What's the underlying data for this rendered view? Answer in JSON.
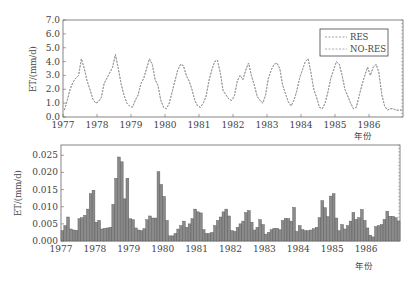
{
  "chart_data": [
    {
      "type": "line",
      "title": "",
      "xlabel": "年份",
      "ylabel": "ET/(mm/d)",
      "ylim": [
        0,
        7
      ],
      "yticks": [
        "0.0",
        "1.0",
        "2.0",
        "3.0",
        "4.0",
        "5.0",
        "6.0",
        "7.0"
      ],
      "xticks": [
        "1977",
        "1978",
        "1979",
        "1980",
        "1981",
        "1982",
        "1983",
        "1984",
        "1985",
        "1986"
      ],
      "legend": {
        "position": "upper right",
        "entries": [
          "RES",
          "NO-RES"
        ]
      },
      "x_start": "1977-01",
      "frequency": "monthly",
      "series": [
        {
          "name": "RES",
          "values": [
            0.5,
            1.2,
            2.0,
            2.5,
            2.8,
            3.0,
            4.2,
            3.5,
            2.6,
            2.0,
            1.3,
            1.0,
            1.1,
            1.4,
            2.4,
            2.8,
            3.2,
            3.6,
            4.5,
            3.5,
            2.4,
            1.6,
            1.0,
            0.8,
            0.7,
            1.2,
            1.6,
            2.4,
            2.8,
            3.5,
            4.2,
            3.8,
            2.7,
            2.3,
            1.2,
            0.7,
            0.6,
            1.0,
            1.8,
            2.6,
            3.4,
            3.8,
            3.7,
            3.0,
            2.6,
            2.0,
            1.2,
            0.8,
            0.7,
            1.0,
            1.5,
            2.6,
            3.4,
            4.0,
            4.1,
            3.2,
            1.9,
            1.6,
            1.3,
            1.2,
            1.5,
            2.6,
            3.0,
            2.7,
            3.4,
            3.9,
            3.0,
            2.3,
            1.5,
            1.2,
            1.0,
            1.6,
            2.8,
            3.4,
            3.8,
            3.9,
            3.5,
            2.3,
            1.7,
            1.1,
            0.8,
            1.2,
            1.9,
            2.8,
            3.4,
            4.0,
            4.2,
            3.2,
            2.0,
            1.4,
            0.7,
            0.6,
            1.0,
            1.8,
            2.8,
            3.4,
            4.0,
            3.8,
            3.0,
            2.0,
            1.5,
            1.0,
            0.6,
            0.7,
            1.5,
            2.3,
            3.0,
            3.6,
            3.0,
            3.6,
            3.8,
            3.2,
            1.6,
            0.8,
            0.5,
            0.6,
            0.6,
            0.5,
            0.5,
            0.5
          ]
        },
        {
          "name": "NO-RES",
          "values": [
            0.5,
            1.2,
            2.0,
            2.5,
            2.8,
            3.0,
            4.2,
            3.5,
            2.6,
            2.0,
            1.3,
            1.0,
            1.1,
            1.4,
            2.4,
            2.8,
            3.2,
            3.6,
            4.5,
            3.5,
            2.4,
            1.6,
            1.0,
            0.8,
            0.7,
            1.2,
            1.6,
            2.4,
            2.8,
            3.5,
            4.2,
            3.8,
            2.7,
            2.3,
            1.2,
            0.7,
            0.6,
            1.0,
            1.8,
            2.6,
            3.4,
            3.8,
            3.7,
            3.0,
            2.6,
            2.0,
            1.2,
            0.8,
            0.7,
            1.0,
            1.5,
            2.6,
            3.4,
            4.0,
            4.1,
            3.2,
            1.9,
            1.6,
            1.3,
            1.2,
            1.5,
            2.6,
            3.0,
            2.7,
            3.4,
            3.9,
            3.0,
            2.3,
            1.5,
            1.2,
            1.0,
            1.6,
            2.8,
            3.4,
            3.8,
            3.9,
            3.5,
            2.3,
            1.7,
            1.1,
            0.8,
            1.2,
            1.9,
            2.8,
            3.4,
            4.0,
            4.2,
            3.2,
            2.0,
            1.4,
            0.7,
            0.6,
            1.0,
            1.8,
            2.8,
            3.4,
            4.0,
            3.8,
            3.0,
            2.0,
            1.5,
            1.0,
            0.6,
            0.7,
            1.5,
            2.3,
            3.0,
            3.6,
            3.0,
            3.6,
            3.8,
            3.2,
            1.6,
            0.8,
            0.5,
            0.6,
            0.6,
            0.5,
            0.5,
            0.5
          ]
        }
      ]
    },
    {
      "type": "bar",
      "title": "",
      "xlabel": "年份",
      "ylabel": "ET/(mm/d)",
      "ylim": [
        0,
        0.028
      ],
      "yticks": [
        "0.000",
        "0.005",
        "0.010",
        "0.015",
        "0.020",
        "0.025"
      ],
      "xticks": [
        "1977",
        "1978",
        "1979",
        "1980",
        "1981",
        "1982",
        "1983",
        "1984",
        "1985",
        "1986"
      ],
      "x_start": "1977-01",
      "frequency": "monthly",
      "series": [
        {
          "name": "RES − NO-RES difference",
          "values": [
            0.003,
            0.0045,
            0.007,
            0.0035,
            0.0032,
            0.0031,
            0.0065,
            0.0068,
            0.0075,
            0.0093,
            0.0138,
            0.0148,
            0.0055,
            0.006,
            0.0035,
            0.0037,
            0.0038,
            0.004,
            0.0107,
            0.0183,
            0.0245,
            0.0231,
            0.0123,
            0.0183,
            0.0065,
            0.0062,
            0.0038,
            0.0032,
            0.003,
            0.0036,
            0.0062,
            0.0073,
            0.0067,
            0.0067,
            0.0202,
            0.0165,
            0.013,
            0.006,
            0.0015,
            0.0015,
            0.0022,
            0.0035,
            0.0045,
            0.0058,
            0.004,
            0.005,
            0.0065,
            0.0093,
            0.0085,
            0.0082,
            0.0033,
            0.0022,
            0.0022,
            0.0025,
            0.0045,
            0.006,
            0.007,
            0.0085,
            0.0093,
            0.0073,
            0.003,
            0.0028,
            0.004,
            0.005,
            0.0058,
            0.0083,
            0.0089,
            0.0055,
            0.0032,
            0.004,
            0.0062,
            0.0048,
            0.002,
            0.0025,
            0.0033,
            0.0037,
            0.0037,
            0.0033,
            0.006,
            0.0066,
            0.0065,
            0.0058,
            0.0098,
            0.0028,
            0.0045,
            0.0033,
            0.003,
            0.003,
            0.0032,
            0.0036,
            0.004,
            0.0068,
            0.0118,
            0.0097,
            0.0071,
            0.0131,
            0.0138,
            0.0067,
            0.003,
            0.0048,
            0.0035,
            0.0045,
            0.0058,
            0.0083,
            0.0063,
            0.0068,
            0.0092,
            0.006,
            0.0038,
            0.0017,
            0.0012,
            0.0042,
            0.0045,
            0.0048,
            0.0063,
            0.0087,
            0.0072,
            0.0072,
            0.0068,
            0.0058
          ]
        }
      ]
    }
  ],
  "top_chart": {
    "ylabel": "ET/(mm/d)",
    "xlabel": "年份",
    "legend_res": "RES",
    "legend_nores": "NO-RES"
  },
  "bottom_chart": {
    "ylabel": "ET/(mm/d)",
    "xlabel": "年份"
  }
}
